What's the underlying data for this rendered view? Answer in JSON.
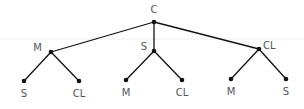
{
  "diagram": {
    "type": "tree",
    "colors": {
      "edge": "#111111",
      "node": "#111111",
      "label": "#555555",
      "rule": "#eeeeee"
    },
    "root": {
      "id": "root",
      "label": "C",
      "x": 154,
      "y": 22,
      "lx": 154,
      "ly": 13,
      "anchor": "middle"
    },
    "level1": [
      {
        "id": "m",
        "label": "M",
        "x": 51,
        "y": 52,
        "lx": 42,
        "ly": 51,
        "anchor": "end"
      },
      {
        "id": "s",
        "label": "S",
        "x": 154,
        "y": 51,
        "lx": 147,
        "ly": 50,
        "anchor": "end"
      },
      {
        "id": "cl",
        "label": "CL",
        "x": 259,
        "y": 49,
        "lx": 263,
        "ly": 49,
        "anchor": "start"
      }
    ],
    "level2": [
      {
        "parent": "m",
        "label": "S",
        "x": 24,
        "y": 81,
        "lx": 24,
        "ly": 97
      },
      {
        "parent": "m",
        "label": "CL",
        "x": 79,
        "y": 81,
        "lx": 79,
        "ly": 97
      },
      {
        "parent": "s",
        "label": "M",
        "x": 126,
        "y": 80,
        "lx": 126,
        "ly": 96
      },
      {
        "parent": "s",
        "label": "CL",
        "x": 182,
        "y": 80,
        "lx": 182,
        "ly": 96
      },
      {
        "parent": "cl",
        "label": "M",
        "x": 231,
        "y": 79,
        "lx": 231,
        "ly": 95
      },
      {
        "parent": "cl",
        "label": "S",
        "x": 286,
        "y": 79,
        "lx": 286,
        "ly": 95
      }
    ]
  }
}
